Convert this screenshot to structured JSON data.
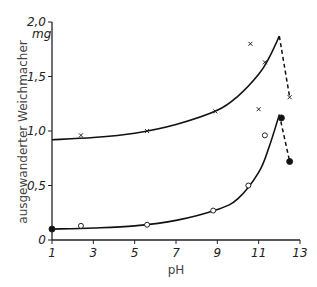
{
  "chart_data": {
    "type": "line",
    "title": "",
    "xlabel": "pH",
    "ylabel": "ausgewanderter Weichmacher",
    "y_unit": "mg",
    "xlim": [
      1,
      13
    ],
    "ylim": [
      0,
      2.0
    ],
    "x_ticks": [
      1,
      3,
      5,
      7,
      9,
      11,
      13
    ],
    "x_tick_labels": [
      "1",
      "3",
      "5",
      "7",
      "9",
      "11",
      "13"
    ],
    "y_ticks": [
      0,
      0.5,
      1.0,
      1.5,
      2.0
    ],
    "y_tick_labels": [
      "0",
      "0,5",
      "1,0",
      "1,5",
      "2,0"
    ],
    "grid": false,
    "legend": null,
    "series": [
      {
        "name": "upper (x markers)",
        "marker": "x",
        "points": [
          [
            2.4,
            0.96
          ],
          [
            5.6,
            1.0
          ],
          [
            8.9,
            1.18
          ],
          [
            10.6,
            1.8
          ],
          [
            11.0,
            1.2
          ],
          [
            11.3,
            1.63
          ],
          [
            12.5,
            1.31
          ]
        ],
        "fit_curve": [
          [
            1,
            0.92
          ],
          [
            3,
            0.94
          ],
          [
            5,
            0.98
          ],
          [
            7,
            1.06
          ],
          [
            9,
            1.19
          ],
          [
            10,
            1.32
          ],
          [
            11,
            1.52
          ],
          [
            11.5,
            1.67
          ],
          [
            12.0,
            1.87
          ]
        ],
        "dashed_segment": [
          [
            12.0,
            1.87
          ],
          [
            12.5,
            1.31
          ]
        ]
      },
      {
        "name": "lower (circle markers)",
        "marker": "circle",
        "points": [
          [
            1.0,
            0.1
          ],
          [
            2.4,
            0.13
          ],
          [
            5.6,
            0.14
          ],
          [
            8.8,
            0.27
          ],
          [
            10.5,
            0.5
          ],
          [
            11.3,
            0.96
          ],
          [
            12.1,
            1.12
          ],
          [
            12.5,
            0.72
          ]
        ],
        "filled_points": [
          [
            1.0,
            0.1
          ],
          [
            12.1,
            1.12
          ],
          [
            12.5,
            0.72
          ]
        ],
        "fit_curve": [
          [
            1,
            0.1
          ],
          [
            3,
            0.11
          ],
          [
            5,
            0.13
          ],
          [
            7,
            0.18
          ],
          [
            9,
            0.28
          ],
          [
            10,
            0.38
          ],
          [
            11,
            0.62
          ],
          [
            11.5,
            0.85
          ],
          [
            12.0,
            1.15
          ]
        ],
        "dashed_segment": [
          [
            12.0,
            1.15
          ],
          [
            12.5,
            0.72
          ]
        ]
      }
    ]
  }
}
